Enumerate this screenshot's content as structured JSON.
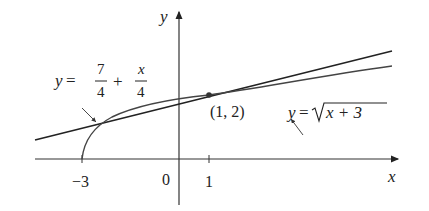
{
  "diagram": {
    "type": "function-graph",
    "axes": {
      "x_label": "x",
      "y_label": "y",
      "x_ticks": [
        "-3",
        "0",
        "1"
      ]
    },
    "curves": [
      {
        "name": "tangent-line",
        "label_lhs": "y =",
        "label_frac1_num": "7",
        "label_frac1_den": "4",
        "label_plus": "+",
        "label_frac2_num": "x",
        "label_frac2_den": "4"
      },
      {
        "name": "sqrt-curve",
        "label_lhs": "y =",
        "label_radicand": "x + 3"
      }
    ],
    "point": {
      "label": "(1, 2)",
      "x": 1,
      "y": 2
    },
    "colors": {
      "line": "#222222",
      "curve": "#444444",
      "axis": "#333333"
    }
  }
}
